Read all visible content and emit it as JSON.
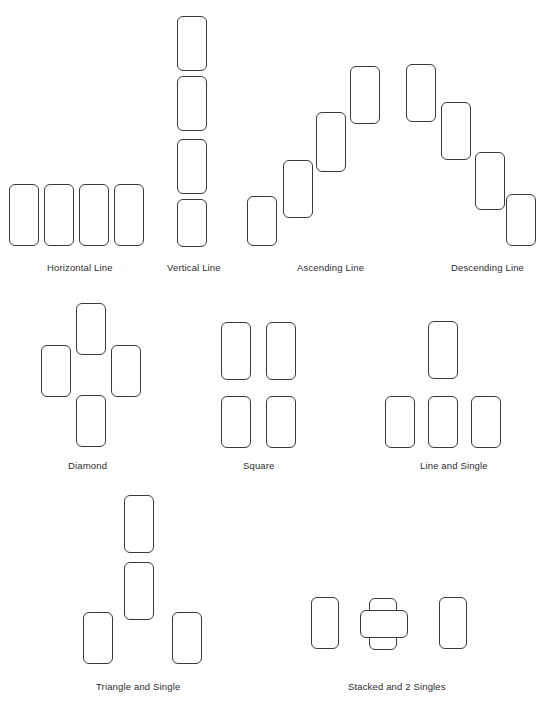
{
  "canvas": {
    "width": 544,
    "height": 702,
    "background": "#ffffff",
    "stroke_color": "#3a3a3a",
    "label_color": "#2b2b2b"
  },
  "card": {
    "width": 30,
    "height": 60,
    "corner_radius": 6
  },
  "patterns": [
    {
      "id": "horizontal-line",
      "label": "Horizontal Line",
      "label_x": 47,
      "label_y": 262,
      "cards": [
        {
          "x": 9,
          "y": 184,
          "w": 30,
          "h": 62
        },
        {
          "x": 44,
          "y": 184,
          "w": 30,
          "h": 62
        },
        {
          "x": 79,
          "y": 184,
          "w": 30,
          "h": 62
        },
        {
          "x": 114,
          "y": 184,
          "w": 30,
          "h": 62
        }
      ]
    },
    {
      "id": "vertical-line",
      "label": "Vertical Line",
      "label_x": 167,
      "label_y": 262,
      "cards": [
        {
          "x": 177,
          "y": 16,
          "w": 30,
          "h": 55
        },
        {
          "x": 177,
          "y": 76,
          "w": 30,
          "h": 55
        },
        {
          "x": 177,
          "y": 139,
          "w": 30,
          "h": 55
        },
        {
          "x": 177,
          "y": 199,
          "w": 30,
          "h": 48
        }
      ]
    },
    {
      "id": "ascending-line",
      "label": "Ascending Line",
      "label_x": 297,
      "label_y": 262,
      "cards": [
        {
          "x": 247,
          "y": 196,
          "w": 30,
          "h": 50
        },
        {
          "x": 283,
          "y": 160,
          "w": 30,
          "h": 58
        },
        {
          "x": 316,
          "y": 112,
          "w": 30,
          "h": 60
        },
        {
          "x": 350,
          "y": 66,
          "w": 30,
          "h": 58
        }
      ]
    },
    {
      "id": "descending-line",
      "label": "Descending Line",
      "label_x": 451,
      "label_y": 262,
      "cards": [
        {
          "x": 406,
          "y": 64,
          "w": 30,
          "h": 58
        },
        {
          "x": 441,
          "y": 102,
          "w": 30,
          "h": 58
        },
        {
          "x": 475,
          "y": 152,
          "w": 30,
          "h": 58
        },
        {
          "x": 506,
          "y": 194,
          "w": 30,
          "h": 52
        }
      ]
    },
    {
      "id": "diamond",
      "label": "Diamond",
      "label_x": 68,
      "label_y": 460,
      "cards": [
        {
          "x": 76,
          "y": 303,
          "w": 30,
          "h": 52
        },
        {
          "x": 41,
          "y": 345,
          "w": 30,
          "h": 52
        },
        {
          "x": 111,
          "y": 345,
          "w": 30,
          "h": 52
        },
        {
          "x": 76,
          "y": 395,
          "w": 30,
          "h": 52
        }
      ]
    },
    {
      "id": "square",
      "label": "Square",
      "label_x": 243,
      "label_y": 460,
      "cards": [
        {
          "x": 221,
          "y": 322,
          "w": 30,
          "h": 58
        },
        {
          "x": 266,
          "y": 322,
          "w": 30,
          "h": 58
        },
        {
          "x": 221,
          "y": 396,
          "w": 30,
          "h": 52
        },
        {
          "x": 266,
          "y": 396,
          "w": 30,
          "h": 52
        }
      ]
    },
    {
      "id": "line-and-single",
      "label": "Line and Single",
      "label_x": 420,
      "label_y": 460,
      "cards": [
        {
          "x": 428,
          "y": 321,
          "w": 30,
          "h": 58
        },
        {
          "x": 385,
          "y": 396,
          "w": 30,
          "h": 52
        },
        {
          "x": 428,
          "y": 396,
          "w": 30,
          "h": 52
        },
        {
          "x": 471,
          "y": 396,
          "w": 30,
          "h": 52
        }
      ]
    },
    {
      "id": "triangle-and-single",
      "label": "Triangle and Single",
      "label_x": 96,
      "label_y": 681,
      "cards": [
        {
          "x": 124,
          "y": 495,
          "w": 30,
          "h": 58
        },
        {
          "x": 124,
          "y": 562,
          "w": 30,
          "h": 58
        },
        {
          "x": 83,
          "y": 612,
          "w": 30,
          "h": 52
        },
        {
          "x": 172,
          "y": 612,
          "w": 30,
          "h": 52
        }
      ]
    },
    {
      "id": "stacked-and-2-singles",
      "label": "Stacked and 2 Singles",
      "label_x": 348,
      "label_y": 681,
      "cards": [
        {
          "x": 311,
          "y": 597,
          "w": 28,
          "h": 52
        },
        {
          "x": 369,
          "y": 598,
          "w": 28,
          "h": 52
        },
        {
          "x": 360,
          "y": 610,
          "w": 48,
          "h": 28
        },
        {
          "x": 439,
          "y": 597,
          "w": 28,
          "h": 52
        }
      ]
    }
  ]
}
